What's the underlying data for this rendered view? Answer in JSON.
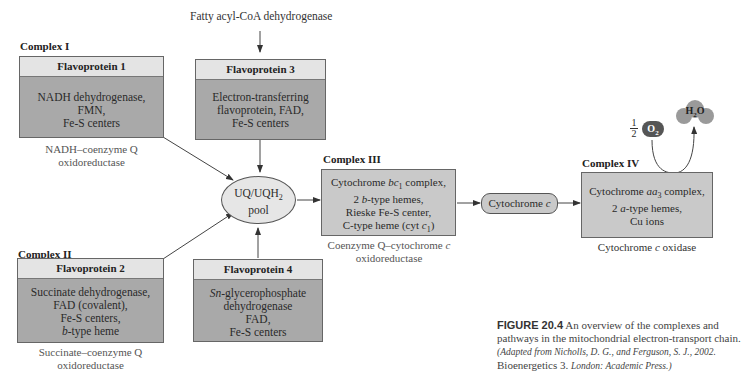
{
  "diagram": {
    "top_input": "Fatty acyl-CoA dehydrogenase",
    "complex1": {
      "label": "Complex I",
      "head": "Flavoprotein 1",
      "lines": [
        "NADH dehydrogenase,",
        "FMN,",
        "Fe-S centers"
      ],
      "caption": [
        "NADH–coenzyme Q",
        "oxidoreductase"
      ]
    },
    "fp3": {
      "head": "Flavoprotein 3",
      "lines": [
        "Electron-transferring",
        "flavoprotein, FAD,",
        "Fe-S centers"
      ]
    },
    "complex2": {
      "label": "Complex II",
      "head": "Flavoprotein 2",
      "lines": [
        "Succinate dehydrogenase,",
        "FAD (covalent),",
        "Fe-S centers,",
        "b-type heme"
      ],
      "line4_italic": "b",
      "line4_rest": "-type heme",
      "caption": [
        "Succinate–coenzyme Q",
        "oxidoreductase"
      ]
    },
    "fp4": {
      "head": "Flavoprotein 4",
      "line1_italic": "Sn",
      "line1_rest": "-glycerophosphate",
      "lines": [
        "Sn-glycerophosphate",
        "dehydrogenase",
        "FAD,",
        "Fe-S centers"
      ]
    },
    "pool": {
      "line1": "UQ/UQH",
      "line1_sub": "2",
      "line2": "pool"
    },
    "complex3": {
      "label": "Complex III",
      "lines": [
        "Cytochrome bc1 complex,",
        "2 b-type hemes,",
        "Rieske Fe-S center,",
        "C-type heme (cyt c1)"
      ],
      "caption": [
        "Coenzyme Q–cytochrome c",
        "oxidoreductase"
      ]
    },
    "cytc": {
      "label": "Cytochrome c"
    },
    "complex4": {
      "label": "Complex IV",
      "lines": [
        "Cytochrome aa3 complex,",
        "2 a-type hemes,",
        "Cu ions"
      ],
      "caption": "Cytochrome c oxidase"
    },
    "oxygen": {
      "fraction_num": "1",
      "fraction_den": "2",
      "molecule": "O2"
    },
    "water": {
      "molecule": "H2O"
    }
  },
  "figure_caption": {
    "number": "FIGURE 20.4",
    "text": "An overview of the complexes and pathways in the mitochondrial electron-transport chain.",
    "citation": "(Adapted from Nicholls, D. G., and Ferguson, S. J., 2002.",
    "book": "Bioenergetics 3.",
    "publisher": "London: Academic Press.)"
  },
  "colors": {
    "dark_box": "#a9a9a9",
    "light_box": "#c9c9c9",
    "header": "#e4e4e4",
    "o2": "#555555",
    "h2o": "#999999"
  }
}
